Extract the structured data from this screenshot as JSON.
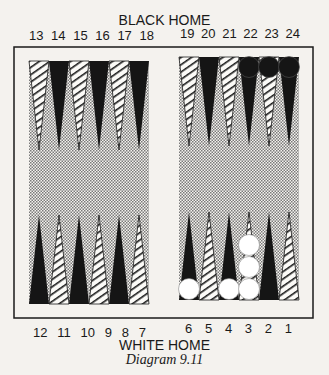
{
  "title": "BLACK HOME",
  "bottom_title": "WHITE HOME",
  "caption": "Diagram 9.11",
  "top_points_left": [
    "13",
    "14",
    "15",
    "16",
    "17",
    "18"
  ],
  "top_points_right": [
    "19",
    "20",
    "21",
    "22",
    "23",
    "24"
  ],
  "bottom_points_left": [
    "12",
    "11",
    "10",
    "9",
    "8",
    "7"
  ],
  "bottom_points_right": [
    "6",
    "5",
    "4",
    "3",
    "2",
    "1"
  ],
  "checkers": {
    "black": [
      {
        "point": 22,
        "count": 1
      },
      {
        "point": 23,
        "count": 1
      },
      {
        "point": 24,
        "count": 1
      }
    ],
    "white": [
      {
        "point": 6,
        "count": 1
      },
      {
        "point": 4,
        "count": 1
      },
      {
        "point": 3,
        "count": 3
      }
    ]
  },
  "colors": {
    "black": "#151515",
    "paper": "#f4f2ee",
    "stipple": "#9a9a9a"
  }
}
